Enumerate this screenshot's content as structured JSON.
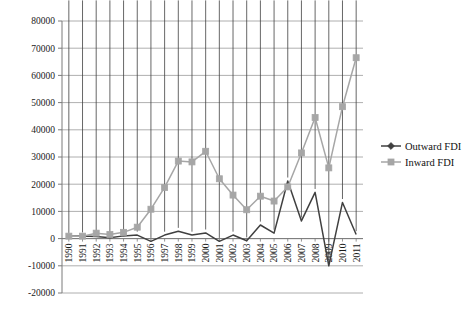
{
  "chart_data": {
    "type": "line",
    "title": "",
    "subtitle": "",
    "xlabel": "",
    "ylabel": "",
    "grid": true,
    "legend_position": "right",
    "ylim": [
      -20000,
      80000
    ],
    "ytick_step": 10000,
    "categories": [
      "1990",
      "1991",
      "1992",
      "1993",
      "1994",
      "1995",
      "1996",
      "1997",
      "1998",
      "1999",
      "2000",
      "2001",
      "2002",
      "2003",
      "2004",
      "2005",
      "2006",
      "2007",
      "2008",
      "2009",
      "2010",
      "2011"
    ],
    "ytick_labels": [
      "80000",
      "70000",
      "60000",
      "50000",
      "40000",
      "30000",
      "20000",
      "10000",
      "0",
      "-10000",
      "-20000"
    ],
    "series": [
      {
        "name": "Outward FDI",
        "color": "#404040",
        "marker": "diamond",
        "values": [
          830,
          1000,
          800,
          300,
          1000,
          1300,
          -1000,
          1300,
          2700,
          1300,
          2100,
          -1000,
          1300,
          -800,
          5000,
          2000,
          21200,
          6500,
          17000,
          -10000,
          13300,
          1500
        ]
      },
      {
        "name": "Inward FDI",
        "color": "#a6a6a6",
        "marker": "square",
        "values": [
          900,
          900,
          2000,
          1500,
          2300,
          4200,
          10800,
          18800,
          28500,
          28200,
          32100,
          22000,
          16000,
          10600,
          15600,
          13800,
          19000,
          31500,
          44500,
          26000,
          48500,
          66500
        ]
      }
    ],
    "annotations": []
  },
  "legend": {
    "items": [
      {
        "label": "Outward FDI",
        "color": "#404040",
        "marker": "diamond"
      },
      {
        "label": "Inward FDI",
        "color": "#a6a6a6",
        "marker": "square"
      }
    ]
  }
}
